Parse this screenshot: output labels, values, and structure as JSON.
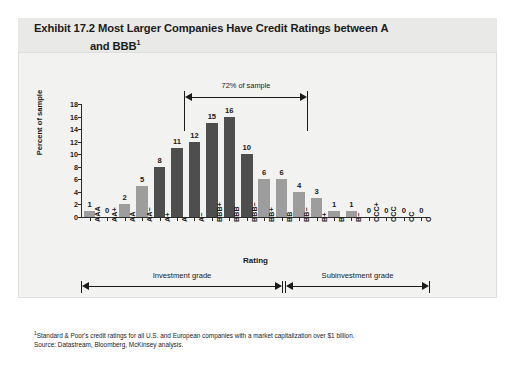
{
  "title": {
    "line1": "Exhibit 17.2 Most Larger Companies Have Credit Ratings between A",
    "line2": "and BBB",
    "superscript": "1"
  },
  "annotation": {
    "pct_of_sample": "72% of sample"
  },
  "grades": {
    "investment": "Investment grade",
    "subinvestment": "Subinvestment grade"
  },
  "footnotes": {
    "marker": "1",
    "note": "Standard & Poor's credit ratings for all U.S. and European companies with a market capitalization over $1 billion.",
    "source": "Source: Datastream, Bloomberg, McKinsey analysis."
  },
  "colors": {
    "bar_dark": "#4e4e4e",
    "bar_light": "#9d9d9d",
    "panel_bg": "#f2f2f0",
    "title_bg": "#e9e9e7",
    "axis": "#2b2b2b"
  },
  "chart_data": {
    "type": "bar",
    "title": "Exhibit 17.2 Most Larger Companies Have Credit Ratings between A and BBB",
    "xlabel": "Rating",
    "ylabel": "Percent of sample",
    "ylim": [
      0,
      18
    ],
    "yticks": [
      0,
      2,
      4,
      6,
      8,
      10,
      12,
      14,
      16,
      18
    ],
    "grid": false,
    "legend": "none",
    "categories": [
      "AAA",
      "AA+",
      "AA",
      "AA−",
      "A+",
      "A",
      "A−",
      "BBB+",
      "BBB",
      "BBB−",
      "BB+",
      "BB",
      "BB−",
      "B+",
      "B",
      "B−",
      "CCC+",
      "CCC",
      "CC",
      "C"
    ],
    "values": [
      1,
      0,
      2,
      5,
      8,
      11,
      12,
      15,
      16,
      10,
      6,
      6,
      4,
      3,
      1,
      1,
      0,
      0,
      0,
      0
    ],
    "bar_colors": [
      "light",
      "light",
      "light",
      "light",
      "dark",
      "dark",
      "dark",
      "dark",
      "dark",
      "dark",
      "light",
      "light",
      "light",
      "light",
      "light",
      "light",
      "light",
      "light",
      "light",
      "light"
    ],
    "annotations": [
      {
        "text": "72% of sample",
        "spans": [
          "A+",
          "BBB−"
        ],
        "value": 72
      },
      {
        "text": "Investment grade",
        "spans": [
          "AAA",
          "BBB−"
        ]
      },
      {
        "text": "Subinvestment grade",
        "spans": [
          "BB+",
          "C"
        ]
      }
    ]
  }
}
